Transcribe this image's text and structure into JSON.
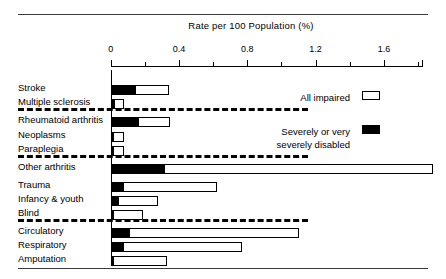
{
  "figure": {
    "axis_title": "Rate per 100 Population (%)"
  },
  "legend": {
    "all_impaired_label": "All impaired",
    "severe_label_line1": "Severely or very",
    "severe_label_line2": "severely disabled",
    "all_impaired_color": "#ffffff",
    "severe_color": "#000000"
  },
  "axis": {
    "tick_labels": [
      "0",
      "0.4",
      "0.8",
      "1.2",
      "1.6"
    ],
    "tick_values": [
      0,
      0.4,
      0.8,
      1.2,
      1.6
    ],
    "minor_tick_values": [
      0.2,
      0.6,
      1.0,
      1.4,
      1.8
    ],
    "min": 0,
    "max": 1.825
  },
  "chart_data": {
    "type": "bar",
    "orientation": "horizontal",
    "title": "",
    "xlabel": "Rate per 100 Population (%)",
    "ylabel": "",
    "xlim": [
      0,
      1.825
    ],
    "grid": false,
    "legend_position": "right-upper",
    "categories": [
      "Stroke",
      "Multiple sclerosis",
      "Rheumatoid arthritis",
      "Neoplasms",
      "Paraplegia",
      "Other arthritis",
      "Trauma",
      "Infancy & youth",
      "Blind",
      "Circulatory",
      "Respiratory",
      "Amputation"
    ],
    "group_breaks_after": [
      "Multiple sclerosis",
      "Paraplegia",
      "Blind"
    ],
    "series": [
      {
        "name": "All impaired",
        "values": [
          0.34,
          0.08,
          0.35,
          0.08,
          0.08,
          1.89,
          0.62,
          0.28,
          0.19,
          1.1,
          0.77,
          0.33
        ]
      },
      {
        "name": "Severely or very severely disabled",
        "values": [
          0.14,
          0.02,
          0.16,
          0.015,
          0.015,
          0.31,
          0.07,
          0.04,
          0.015,
          0.11,
          0.07,
          0.015
        ]
      }
    ]
  },
  "layout": {
    "axis_x0_px": 110.7,
    "px_per_unit": 170.75,
    "row_y_px": [
      85,
      99,
      117,
      132,
      146,
      164,
      182,
      196,
      210,
      228,
      242,
      256
    ],
    "bar_height_px": 10,
    "separator_y_px": [
      108,
      155,
      219
    ],
    "separator_width_px": 290
  }
}
